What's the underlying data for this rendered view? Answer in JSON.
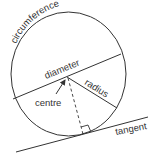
{
  "diagram": {
    "labels": {
      "circumference": "circumference",
      "diameter": "diameter",
      "radius": "radius",
      "centre": "centre",
      "tangent": "tangent"
    },
    "colors": {
      "stroke": "#333333",
      "background": "#ffffff"
    }
  }
}
